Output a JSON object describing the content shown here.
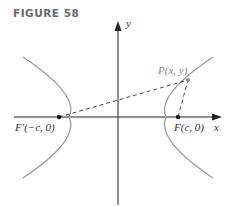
{
  "figure": {
    "title": "FIGURE 58",
    "labels": {
      "y_axis": "y",
      "x_axis": "x",
      "point": "P(x, y)",
      "focus_left": "F′(−c, 0)",
      "focus_right": "F(c, 0)"
    },
    "colors": {
      "curve": "#9a9a9a",
      "axis": "#222222",
      "dashed": "#333333",
      "title": "#6a6a6a"
    }
  }
}
